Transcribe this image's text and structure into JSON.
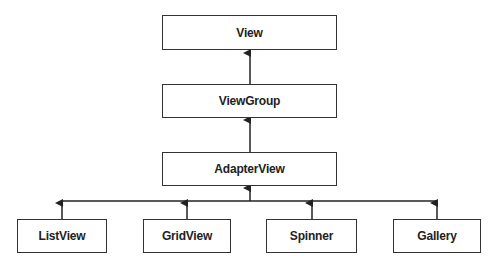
{
  "diagram": {
    "nodes": [
      {
        "id": "view",
        "label": "View"
      },
      {
        "id": "viewgroup",
        "label": "ViewGroup"
      },
      {
        "id": "adapterview",
        "label": "AdapterView"
      },
      {
        "id": "listview",
        "label": "ListView"
      },
      {
        "id": "gridview",
        "label": "GridView"
      },
      {
        "id": "spinner",
        "label": "Spinner"
      },
      {
        "id": "gallery",
        "label": "Gallery"
      }
    ],
    "edges": [
      {
        "from": "viewgroup",
        "to": "view"
      },
      {
        "from": "adapterview",
        "to": "viewgroup"
      },
      {
        "from": "listview",
        "to": "adapterview"
      },
      {
        "from": "gridview",
        "to": "adapterview"
      },
      {
        "from": "spinner",
        "to": "adapterview"
      },
      {
        "from": "gallery",
        "to": "adapterview"
      }
    ],
    "colors": {
      "stroke": "#333333",
      "background": "#ffffff",
      "text": "#222222"
    }
  }
}
